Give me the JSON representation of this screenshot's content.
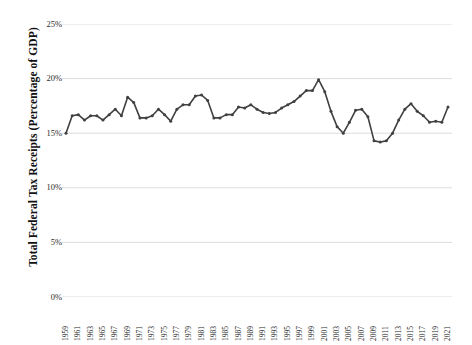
{
  "chart_data": {
    "type": "line",
    "title": "",
    "xlabel": "",
    "ylabel": "Total Federal Tax Receipts (Percentage of GDP)",
    "ylim": [
      0,
      25
    ],
    "y_ticks": [
      "0%",
      "5%",
      "10%",
      "15%",
      "20%",
      "25%"
    ],
    "y_tick_values": [
      0,
      5,
      10,
      15,
      20,
      25
    ],
    "grid": true,
    "legend": "none",
    "series_color": "#404040",
    "gridline_color": "#d9d9d9",
    "marker": "circle",
    "x_tick_labels": [
      "1959",
      "1961",
      "1963",
      "1965",
      "1967",
      "1969",
      "1971",
      "1973",
      "1975",
      "1977",
      "1979",
      "1981",
      "1983",
      "1985",
      "1987",
      "1989",
      "1991",
      "1993",
      "1995",
      "1997",
      "1999",
      "2001",
      "2003",
      "2005",
      "2007",
      "2009",
      "2011",
      "2013",
      "2015",
      "2017",
      "2019",
      "2021"
    ],
    "x": [
      1959,
      1960,
      1961,
      1962,
      1963,
      1964,
      1965,
      1966,
      1967,
      1968,
      1969,
      1970,
      1971,
      1972,
      1973,
      1974,
      1975,
      1976,
      1977,
      1978,
      1979,
      1980,
      1981,
      1982,
      1983,
      1984,
      1985,
      1986,
      1987,
      1988,
      1989,
      1990,
      1991,
      1992,
      1993,
      1994,
      1995,
      1996,
      1997,
      1998,
      1999,
      2000,
      2001,
      2002,
      2003,
      2004,
      2005,
      2006,
      2007,
      2008,
      2009,
      2010,
      2011,
      2012,
      2013,
      2014,
      2015,
      2016,
      2017,
      2018,
      2019,
      2020,
      2021
    ],
    "values": [
      15.0,
      16.6,
      16.7,
      16.2,
      16.6,
      16.6,
      16.2,
      16.7,
      17.2,
      16.6,
      18.3,
      17.8,
      16.4,
      16.4,
      16.6,
      17.2,
      16.7,
      16.1,
      17.2,
      17.6,
      17.6,
      18.4,
      18.5,
      18.0,
      16.4,
      16.4,
      16.7,
      16.7,
      17.4,
      17.3,
      17.6,
      17.2,
      16.9,
      16.8,
      16.9,
      17.3,
      17.6,
      17.9,
      18.4,
      18.9,
      18.9,
      19.9,
      18.8,
      17.0,
      15.6,
      15.0,
      16.0,
      17.1,
      17.2,
      16.5,
      14.3,
      14.2,
      14.3,
      15.0,
      16.2,
      17.2,
      17.7,
      17.0,
      16.6,
      16.0,
      16.1,
      16.0,
      17.4
    ]
  }
}
